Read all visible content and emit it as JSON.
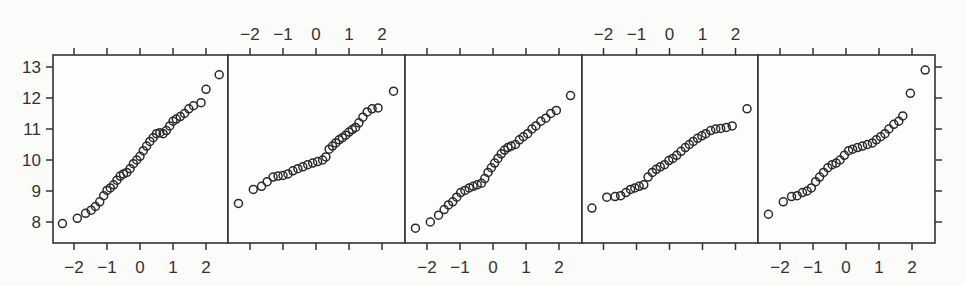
{
  "chart_data": {
    "type": "scatter",
    "subtype": "normal-qq-lattice",
    "title": "",
    "xlabel": "",
    "ylabel": "",
    "layout": {
      "panels": 5,
      "arrangement": "1 row x 5 columns",
      "shared_y": true,
      "grid": false,
      "legend": "none"
    },
    "xlim": [
      -2.6,
      2.6
    ],
    "ylim": [
      7.6,
      13.3
    ],
    "x_ticks": [
      -2,
      -1,
      0,
      1,
      2
    ],
    "x_tick_labels": [
      "−2",
      "−1",
      "0",
      "1",
      "2"
    ],
    "y_ticks": [
      8,
      9,
      10,
      11,
      12,
      13
    ],
    "y_tick_labels": [
      "8",
      "9",
      "10",
      "11",
      "12",
      "13"
    ],
    "x_axis_labels_side": [
      "bottom",
      "top",
      "bottom",
      "top",
      "bottom"
    ],
    "y_axis_labels_side": "left",
    "marker": "open-circle",
    "panels": [
      {
        "name": "panel-1",
        "points": [
          [
            -2.35,
            7.95
          ],
          [
            -1.9,
            8.12
          ],
          [
            -1.65,
            8.28
          ],
          [
            -1.48,
            8.38
          ],
          [
            -1.35,
            8.5
          ],
          [
            -1.22,
            8.65
          ],
          [
            -1.1,
            8.85
          ],
          [
            -1.0,
            9.02
          ],
          [
            -0.9,
            9.1
          ],
          [
            -0.8,
            9.2
          ],
          [
            -0.7,
            9.35
          ],
          [
            -0.6,
            9.48
          ],
          [
            -0.5,
            9.55
          ],
          [
            -0.4,
            9.6
          ],
          [
            -0.3,
            9.72
          ],
          [
            -0.2,
            9.88
          ],
          [
            -0.1,
            10.0
          ],
          [
            0.0,
            10.12
          ],
          [
            0.1,
            10.3
          ],
          [
            0.2,
            10.45
          ],
          [
            0.3,
            10.6
          ],
          [
            0.4,
            10.72
          ],
          [
            0.5,
            10.85
          ],
          [
            0.6,
            10.88
          ],
          [
            0.7,
            10.85
          ],
          [
            0.8,
            10.95
          ],
          [
            0.9,
            11.1
          ],
          [
            1.0,
            11.25
          ],
          [
            1.1,
            11.32
          ],
          [
            1.22,
            11.4
          ],
          [
            1.35,
            11.5
          ],
          [
            1.48,
            11.65
          ],
          [
            1.62,
            11.75
          ],
          [
            1.85,
            11.85
          ],
          [
            2.0,
            12.28
          ],
          [
            2.4,
            12.75
          ]
        ]
      },
      {
        "name": "panel-2",
        "points": [
          [
            -2.35,
            8.6
          ],
          [
            -1.9,
            9.05
          ],
          [
            -1.65,
            9.15
          ],
          [
            -1.48,
            9.3
          ],
          [
            -1.3,
            9.45
          ],
          [
            -1.15,
            9.48
          ],
          [
            -1.0,
            9.5
          ],
          [
            -0.85,
            9.55
          ],
          [
            -0.7,
            9.65
          ],
          [
            -0.55,
            9.72
          ],
          [
            -0.4,
            9.78
          ],
          [
            -0.25,
            9.85
          ],
          [
            -0.1,
            9.9
          ],
          [
            0.05,
            9.95
          ],
          [
            0.2,
            10.0
          ],
          [
            0.3,
            10.1
          ],
          [
            0.4,
            10.35
          ],
          [
            0.5,
            10.45
          ],
          [
            0.6,
            10.55
          ],
          [
            0.7,
            10.65
          ],
          [
            0.8,
            10.72
          ],
          [
            0.9,
            10.8
          ],
          [
            1.0,
            10.9
          ],
          [
            1.1,
            10.98
          ],
          [
            1.2,
            11.05
          ],
          [
            1.3,
            11.2
          ],
          [
            1.42,
            11.38
          ],
          [
            1.55,
            11.55
          ],
          [
            1.7,
            11.65
          ],
          [
            1.88,
            11.68
          ],
          [
            2.35,
            12.22
          ]
        ]
      },
      {
        "name": "panel-3",
        "points": [
          [
            -2.35,
            7.8
          ],
          [
            -1.9,
            8.0
          ],
          [
            -1.65,
            8.22
          ],
          [
            -1.48,
            8.4
          ],
          [
            -1.35,
            8.55
          ],
          [
            -1.22,
            8.65
          ],
          [
            -1.1,
            8.8
          ],
          [
            -0.98,
            8.95
          ],
          [
            -0.85,
            9.02
          ],
          [
            -0.72,
            9.1
          ],
          [
            -0.6,
            9.15
          ],
          [
            -0.48,
            9.2
          ],
          [
            -0.35,
            9.25
          ],
          [
            -0.25,
            9.4
          ],
          [
            -0.15,
            9.6
          ],
          [
            -0.05,
            9.75
          ],
          [
            0.05,
            9.9
          ],
          [
            0.15,
            10.05
          ],
          [
            0.25,
            10.2
          ],
          [
            0.35,
            10.32
          ],
          [
            0.45,
            10.4
          ],
          [
            0.55,
            10.45
          ],
          [
            0.68,
            10.5
          ],
          [
            0.8,
            10.65
          ],
          [
            0.92,
            10.75
          ],
          [
            1.05,
            10.85
          ],
          [
            1.18,
            11.0
          ],
          [
            1.3,
            11.1
          ],
          [
            1.45,
            11.25
          ],
          [
            1.6,
            11.35
          ],
          [
            1.75,
            11.5
          ],
          [
            1.92,
            11.6
          ],
          [
            2.35,
            12.08
          ]
        ]
      },
      {
        "name": "panel-4",
        "points": [
          [
            -2.35,
            8.45
          ],
          [
            -1.9,
            8.8
          ],
          [
            -1.65,
            8.82
          ],
          [
            -1.48,
            8.85
          ],
          [
            -1.32,
            8.95
          ],
          [
            -1.18,
            9.05
          ],
          [
            -1.05,
            9.1
          ],
          [
            -0.92,
            9.15
          ],
          [
            -0.78,
            9.2
          ],
          [
            -0.65,
            9.45
          ],
          [
            -0.52,
            9.6
          ],
          [
            -0.4,
            9.7
          ],
          [
            -0.28,
            9.78
          ],
          [
            -0.15,
            9.85
          ],
          [
            -0.02,
            9.98
          ],
          [
            0.1,
            10.05
          ],
          [
            0.22,
            10.15
          ],
          [
            0.35,
            10.28
          ],
          [
            0.48,
            10.4
          ],
          [
            0.6,
            10.5
          ],
          [
            0.72,
            10.6
          ],
          [
            0.85,
            10.7
          ],
          [
            0.98,
            10.78
          ],
          [
            1.1,
            10.85
          ],
          [
            1.25,
            10.95
          ],
          [
            1.4,
            11.0
          ],
          [
            1.55,
            11.02
          ],
          [
            1.72,
            11.05
          ],
          [
            1.9,
            11.1
          ],
          [
            2.35,
            11.65
          ]
        ]
      },
      {
        "name": "panel-5",
        "points": [
          [
            -2.35,
            8.25
          ],
          [
            -1.9,
            8.65
          ],
          [
            -1.65,
            8.82
          ],
          [
            -1.48,
            8.85
          ],
          [
            -1.32,
            8.95
          ],
          [
            -1.18,
            9.0
          ],
          [
            -1.05,
            9.1
          ],
          [
            -0.92,
            9.3
          ],
          [
            -0.8,
            9.45
          ],
          [
            -0.68,
            9.6
          ],
          [
            -0.55,
            9.75
          ],
          [
            -0.42,
            9.85
          ],
          [
            -0.3,
            9.9
          ],
          [
            -0.18,
            10.0
          ],
          [
            -0.05,
            10.15
          ],
          [
            0.08,
            10.3
          ],
          [
            0.2,
            10.35
          ],
          [
            0.35,
            10.4
          ],
          [
            0.5,
            10.45
          ],
          [
            0.65,
            10.5
          ],
          [
            0.8,
            10.55
          ],
          [
            0.92,
            10.65
          ],
          [
            1.05,
            10.75
          ],
          [
            1.18,
            10.85
          ],
          [
            1.3,
            11.0
          ],
          [
            1.45,
            11.15
          ],
          [
            1.6,
            11.25
          ],
          [
            1.72,
            11.42
          ],
          [
            1.95,
            12.15
          ],
          [
            2.4,
            12.9
          ]
        ]
      }
    ]
  }
}
